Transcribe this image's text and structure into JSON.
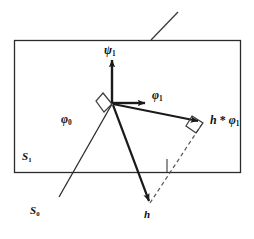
{
  "figure": {
    "background_color": "#ffffff",
    "line_color": "#1a1a1a",
    "width": 254,
    "height": 239
  },
  "labels": {
    "psi1": {
      "text": "ψ",
      "sub": "1",
      "name": "psi-1"
    },
    "phi1": {
      "text": "φ",
      "sub": "1",
      "name": "phi-1"
    },
    "phi0": {
      "text": "φ",
      "sub": "0",
      "name": "phi-0"
    },
    "h_star_phi1": {
      "text": "h",
      "op": "*",
      "text2": "φ",
      "sub": "1",
      "name": "h-star-phi-1"
    },
    "h": {
      "text": "h",
      "name": "h"
    },
    "S1": {
      "text": "S",
      "sub": "1",
      "name": "plane-s1"
    },
    "S0": {
      "text": "S",
      "sub": "0",
      "name": "point-s0"
    }
  },
  "geometry": {
    "plane_rect": {
      "x1": 14,
      "y1": 40,
      "x2": 241,
      "y2": 173
    },
    "normal_tick": {
      "x1": 151,
      "y1": 40,
      "x2": 178,
      "y2": 12
    },
    "origin": {
      "x": 112,
      "y": 104
    },
    "vectors": [
      {
        "name": "psi1",
        "to_x": 112,
        "to_y": 57,
        "style": "solid"
      },
      {
        "name": "phi1",
        "to_x": 147,
        "to_y": 103,
        "style": "solid"
      },
      {
        "name": "h_star_phi1",
        "to_x": 201,
        "to_y": 122,
        "style": "solid"
      },
      {
        "name": "h",
        "to_x": 150,
        "to_y": 204,
        "style": "solid"
      }
    ],
    "phi0_ray": {
      "x1": 59,
      "y1": 196,
      "x2": 112,
      "y2": 104
    },
    "s0_ray_tail": {
      "x1": 59,
      "y1": 196
    },
    "dashed_hp": {
      "x1": 150,
      "y1": 204,
      "x2": 202,
      "y2": 124
    },
    "right_angle_origin": [
      [
        103,
        94
      ],
      [
        112,
        104
      ],
      [
        105,
        112
      ],
      [
        97,
        102
      ]
    ],
    "right_angle_tip": [
      [
        193,
        117
      ],
      [
        203,
        123
      ],
      [
        196,
        133
      ],
      [
        187,
        127
      ]
    ],
    "baseline_tick": {
      "x1": 167,
      "y1": 173,
      "x2": 167,
      "y2": 160
    }
  }
}
